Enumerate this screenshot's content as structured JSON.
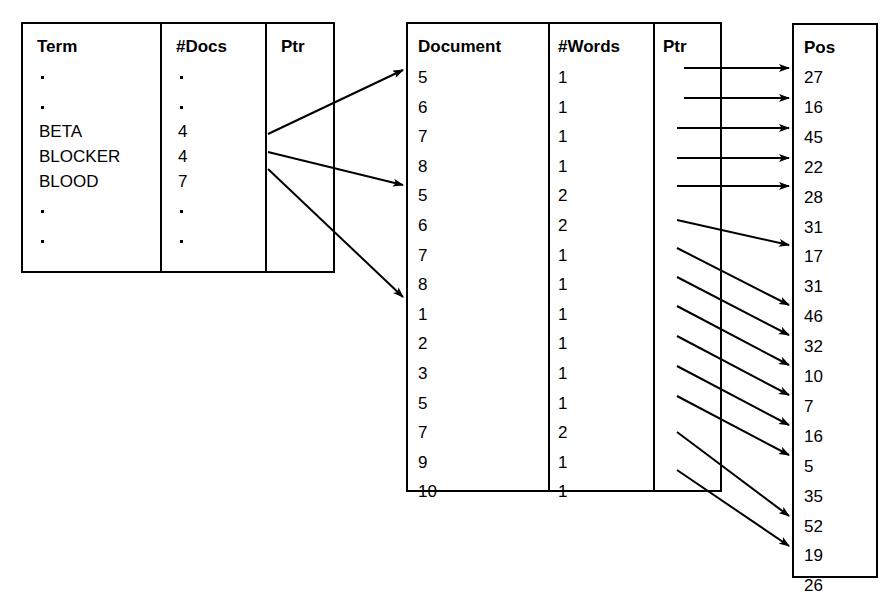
{
  "figure": {
    "type": "inverted-index-diagram"
  },
  "tables": {
    "dictionary": {
      "name": "dictionary-table",
      "headers": [
        "Term",
        "#Docs",
        "Ptr"
      ],
      "rows": [
        {
          "term": ".",
          "docs": ".",
          "is_dot": true
        },
        {
          "term": ".",
          "docs": ".",
          "is_dot": true
        },
        {
          "term": "BETA",
          "docs": "4",
          "is_dot": false
        },
        {
          "term": "BLOCKER",
          "docs": "4",
          "is_dot": false
        },
        {
          "term": "BLOOD",
          "docs": "7",
          "is_dot": false
        },
        {
          "term": ".",
          "docs": ".",
          "is_dot": true
        },
        {
          "term": ".",
          "docs": ".",
          "is_dot": true
        }
      ]
    },
    "postings": {
      "name": "document-postings-table",
      "headers": [
        "Document",
        "#Words",
        "Ptr"
      ],
      "documents": [
        "5",
        "6",
        "7",
        "8",
        "5",
        "6",
        "7",
        "8",
        "1",
        "2",
        "3",
        "5",
        "7",
        "9",
        "10"
      ],
      "words": [
        "1",
        "1",
        "1",
        "1",
        "2",
        "2",
        "1",
        "1",
        "1",
        "1",
        "1",
        "1",
        "2",
        "1",
        "1"
      ]
    },
    "positions": {
      "name": "position-table",
      "headers": [
        "Pos"
      ],
      "values": [
        "27",
        "16",
        "45",
        "22",
        "28",
        "31",
        "17",
        "31",
        "46",
        "32",
        "10",
        "7",
        "16",
        "5",
        "35",
        "52",
        "19",
        "26"
      ]
    }
  },
  "arrows": {
    "dictionary_to_postings": [
      {
        "from_term": "BETA",
        "to_document_index": 0
      },
      {
        "from_term": "BLOCKER",
        "to_document_index": 4
      },
      {
        "from_term": "BLOOD",
        "to_document_index": 8
      }
    ],
    "postings_to_positions_count": 13
  },
  "colors": {
    "ink": "#000000",
    "paper": "#ffffff"
  }
}
